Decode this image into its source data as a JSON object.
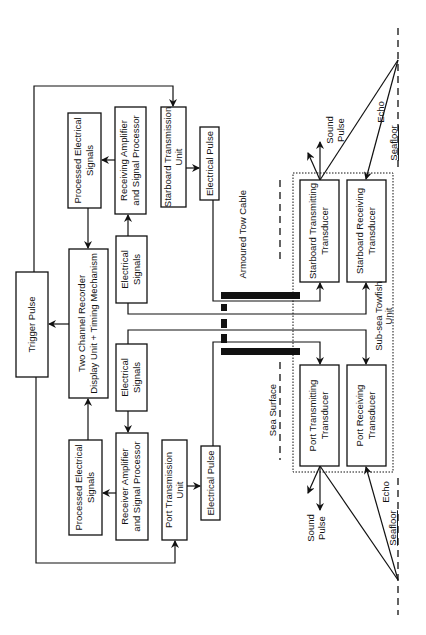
{
  "diagram": {
    "orientation": "rotated 90 degrees counter-clockwise",
    "boxes": {
      "trigger_pulse": {
        "label": "Trigger  Pulse"
      },
      "recorder": {
        "line1": "Two Channel Recorder",
        "line2": "Display Unit + Timing Mechanism"
      },
      "processed_top": {
        "line1": "Processed Electrical",
        "line2": "Signals"
      },
      "processed_bottom": {
        "line1": "Processed Electrical",
        "line2": "Signals"
      },
      "receiving_amp_top": {
        "line1": "Receiving Amplifier",
        "line2": "and Signal Processor"
      },
      "receiver_amp_bottom": {
        "line1": "Receiver Amplifier",
        "line2": "and Signal Processor"
      },
      "electrical_signals_top": {
        "line1": "Electrical",
        "line2": "Signals"
      },
      "electrical_signals_bottom": {
        "line1": "Electrical",
        "line2": "Signals"
      },
      "starboard_transmission_unit": {
        "line1": "Starboard Transmission",
        "line2": "Unit"
      },
      "port_transmission_unit": {
        "line1": "Port Transmission",
        "line2": "Unit"
      },
      "electrical_pulse_top": {
        "label": "Electrical   Pulse"
      },
      "electrical_pulse_bottom": {
        "label": "Electrical Pulse"
      },
      "starboard_transmitting_transducer": {
        "line1": "Starboard Transmitting",
        "line2": "Transducer"
      },
      "starboard_receiving_transducer": {
        "line1": "Starboard Receiving",
        "line2": "Transducer"
      },
      "port_transmitting_transducer": {
        "line1": "Port Transmitting",
        "line2": "Transducer"
      },
      "port_receiving_transducer": {
        "line1": "Port Receiving",
        "line2": "Transducer"
      }
    },
    "labels": {
      "armoured_tow_cable": "Armoured Tow Cable",
      "sea_surface": "Sea Surface",
      "towfish_line1": "Sub-sea Towfish",
      "towfish_line2": "Unit",
      "sound_pulse_top_1": "Sound",
      "sound_pulse_top_2": "Pulse",
      "sound_pulse_bottom_1": "Sound",
      "sound_pulse_bottom_2": "Pulse",
      "echo_top": "Echo",
      "echo_bottom": "Echo",
      "seafloor_top": "Seafloor",
      "seafloor_bottom": "Seafloor"
    }
  }
}
